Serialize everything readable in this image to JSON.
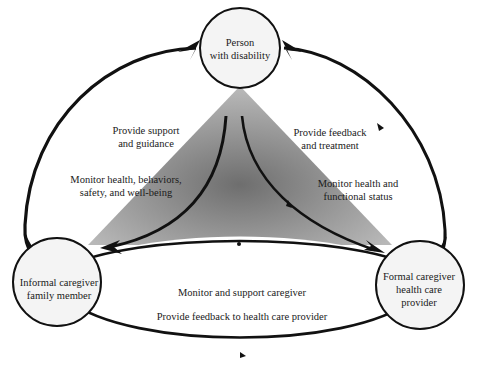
{
  "diagram": {
    "nodes": [
      {
        "id": "person",
        "lines": [
          "Person",
          "with disability"
        ]
      },
      {
        "id": "informal",
        "lines": [
          "Informal caregiver",
          "family member"
        ]
      },
      {
        "id": "formal",
        "lines": [
          "Formal caregiver",
          "health care",
          "provider"
        ]
      }
    ],
    "edge_labels": {
      "left_outer": [
        "Provide support",
        "and guidance"
      ],
      "left_inner": [
        "Monitor health, behaviors,",
        "safety, and well-being"
      ],
      "right_outer": [
        "Provide feedback",
        "and treatment"
      ],
      "right_inner": [
        "Monitor health and",
        "functional status"
      ],
      "bottom_top": [
        "Monitor and support caregiver"
      ],
      "bottom_bottom": [
        "Provide feedback to health care provider"
      ]
    },
    "colors": {
      "node_fill": "#f4f4f4",
      "stroke": "#111111",
      "triangle_center": "#7a7a7a",
      "triangle_edge": "#b4b4b4"
    }
  }
}
